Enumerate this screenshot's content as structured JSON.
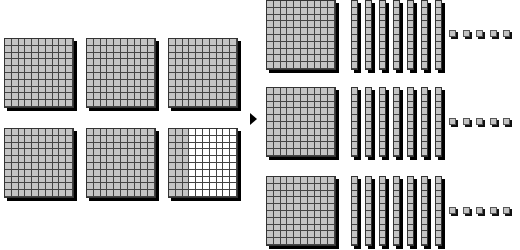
{
  "diagram": {
    "type": "base-ten-blocks",
    "fill_color": "#c4c4c4",
    "grid_line_color": "#444444",
    "shadow_color": "#000000",
    "left": {
      "flats": [
        {
          "filled_columns": 10
        },
        {
          "filled_columns": 10
        },
        {
          "filled_columns": 10
        },
        {
          "filled_columns": 10
        },
        {
          "filled_columns": 10
        },
        {
          "filled_columns": 3
        }
      ],
      "layout": {
        "rows": 2,
        "cols": 3,
        "x": [
          4,
          86,
          168
        ],
        "y": [
          38,
          128
        ]
      }
    },
    "arrow": {
      "icon": "right-arrow-icon",
      "direction": "right"
    },
    "right": {
      "groups": [
        {
          "flats": 1,
          "rods": 7,
          "units": 5,
          "y": 0,
          "unit_y": 30
        },
        {
          "flats": 1,
          "rods": 7,
          "units": 5,
          "y": 87,
          "unit_y": 118
        },
        {
          "flats": 1,
          "rods": 7,
          "units": 5,
          "y": 176,
          "unit_y": 207
        }
      ],
      "flat_x": 266,
      "rod_x0": 351,
      "rod_spacing": 14,
      "unit_x0": 449,
      "unit_spacing": 13.5
    }
  }
}
